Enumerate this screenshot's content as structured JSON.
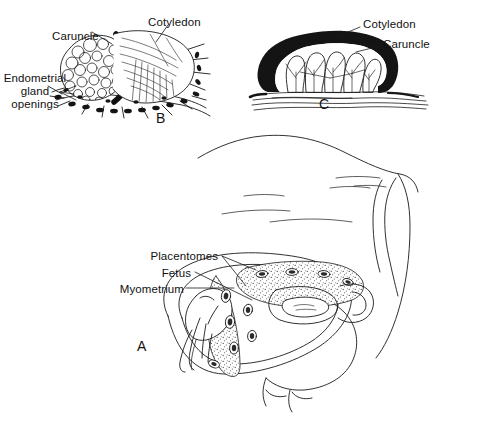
{
  "figure": {
    "background_color": "#ffffff",
    "ink_color": "#1a1a1a",
    "width": 477,
    "height": 422
  },
  "panels": [
    {
      "id": "A",
      "letter": "A",
      "caption": "Sagittal section of the pregnant bovine uterus within the hindquarters",
      "labels": [
        {
          "key": "placentomes",
          "text": "Placentomes"
        },
        {
          "key": "fetus",
          "text": "Fetus"
        },
        {
          "key": "myometrium",
          "text": "Myometrium"
        }
      ]
    },
    {
      "id": "B",
      "letter": "B",
      "caption": "Cotyledon partially lifted from the caruncle",
      "labels": [
        {
          "key": "caruncle",
          "text": "Caruncle"
        },
        {
          "key": "cotyledon",
          "text": "Cotyledon"
        },
        {
          "key": "endometrial_gland_openings",
          "text": "Endometrial\ngland\nopenings"
        }
      ]
    },
    {
      "id": "C",
      "letter": "C",
      "caption": "Cross section through a placentome",
      "labels": [
        {
          "key": "cotyledon",
          "text": "Cotyledon"
        },
        {
          "key": "caruncle",
          "text": "Caruncle"
        }
      ]
    }
  ],
  "panel_a": {
    "label_placentomes": "Placentomes",
    "label_fetus": "Fetus",
    "label_myometrium": "Myometrium",
    "letter": "A"
  },
  "panel_b": {
    "label_caruncle": "Caruncle",
    "label_cotyledon": "Cotyledon",
    "label_endometrial_line1": "Endometrial",
    "label_endometrial_line2": "gland",
    "label_endometrial_line3": "openings",
    "letter": "B"
  },
  "panel_c": {
    "label_cotyledon": "Cotyledon",
    "label_caruncle": "Caruncle",
    "letter": "C"
  }
}
